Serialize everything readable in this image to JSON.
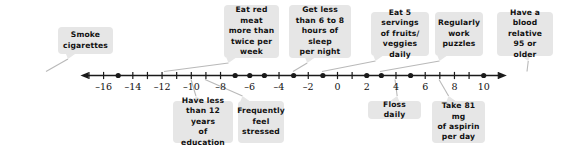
{
  "figure": {
    "width": 571,
    "height": 153
  },
  "chart_data": {
    "type": "scatter",
    "title": "",
    "xlabel": "",
    "ylabel": "",
    "xlim": [
      -17.5,
      11.5
    ],
    "grid": false,
    "legend": false,
    "axis": {
      "tick_min": -17,
      "tick_max": 11,
      "tick_step": 1,
      "labeled_ticks": [
        -16,
        -14,
        -12,
        -10,
        -8,
        -6,
        -4,
        -2,
        0,
        2,
        4,
        6,
        8,
        10
      ],
      "labeled_tick_text": [
        "–16",
        "–14",
        "–12",
        "–10",
        "–8",
        "–6",
        "–4",
        "–2",
        "0",
        "2",
        "4",
        "6",
        "8",
        "10"
      ],
      "arrow_left": true,
      "arrow_right": true
    },
    "points": [
      {
        "x": -15,
        "label": "Smoke\ncigarettes",
        "side": "above"
      },
      {
        "x": -7,
        "label": "Have less\nthan 12 years\nof education",
        "side": "below"
      },
      {
        "x": -6,
        "label": "Eat red meat\nmore than\ntwice per\nweek",
        "side": "above"
      },
      {
        "x": -5,
        "label": "Frequently\nfeel\nstressed",
        "side": "below"
      },
      {
        "x": -3,
        "label": "Get less\nthan 6 to 8\nhours of sleep\nper night",
        "side": "above"
      },
      {
        "x": -1,
        "label": "Eat 5 servings\nof fruits/\nveggies daily",
        "side": "above"
      },
      {
        "x": 2,
        "label": "Floss daily",
        "side": "below"
      },
      {
        "x": 3,
        "label": "Regularly\nwork\npuzzles",
        "side": "above"
      },
      {
        "x": 5,
        "label": "Take 81 mg\nof aspirin\nper day",
        "side": "below"
      },
      {
        "x": 10,
        "label": "Have a\nblood relative\n95 or older",
        "side": "above"
      }
    ]
  },
  "callouts": [
    {
      "id": "smoke-cigarettes",
      "text": "Smoke\ncigarettes",
      "left": 58,
      "top": 27,
      "width": 55,
      "height": 27,
      "tail_x": 46,
      "tail_top": false
    },
    {
      "id": "eat-red-meat",
      "text": "Eat red meat\nmore than\ntwice per\nweek",
      "left": 224,
      "top": 5,
      "width": 55,
      "height": 53,
      "tail_x": 164,
      "tail_top": false
    },
    {
      "id": "get-less-sleep",
      "text": "Get less\nthan 6 to 8\nhours of sleep\nper night",
      "left": 289,
      "top": 5,
      "width": 62,
      "height": 53,
      "tail_x": 293,
      "tail_top": false
    },
    {
      "id": "eat-five-servings",
      "text": "Eat 5 servings\nof fruits/\nveggies daily",
      "left": 371,
      "top": 12,
      "width": 58,
      "height": 44,
      "tail_x": 322,
      "tail_top": false
    },
    {
      "id": "regularly-work-puzzles",
      "text": "Regularly\nwork\npuzzles",
      "left": 435,
      "top": 12,
      "width": 48,
      "height": 44,
      "tail_x": 380,
      "tail_top": false
    },
    {
      "id": "blood-relative",
      "text": "Have a\nblood relative\n95 or older",
      "left": 497,
      "top": 12,
      "width": 56,
      "height": 44,
      "tail_x": 527,
      "tail_top": false
    },
    {
      "id": "less-education",
      "text": "Have less\nthan 12 years\nof education",
      "left": 173,
      "top": 101,
      "width": 60,
      "height": 42,
      "tail_x": 191,
      "tail_top": true
    },
    {
      "id": "feel-stressed",
      "text": "Frequently\nfeel\nstressed",
      "left": 238,
      "top": 101,
      "width": 46,
      "height": 42,
      "tail_x": 205,
      "tail_top": true
    },
    {
      "id": "floss-daily",
      "text": "Floss daily",
      "left": 368,
      "top": 101,
      "width": 53,
      "height": 18,
      "tail_x": 395,
      "tail_top": true
    },
    {
      "id": "take-aspirin",
      "text": "Take 81 mg\nof aspirin\nper day",
      "left": 432,
      "top": 101,
      "width": 53,
      "height": 42,
      "tail_x": 439,
      "tail_top": true
    }
  ],
  "colors": {
    "callout_bg": "#e6e6e6",
    "text": "#111111",
    "axis": "#1a1a1a",
    "background": "#ffffff"
  }
}
